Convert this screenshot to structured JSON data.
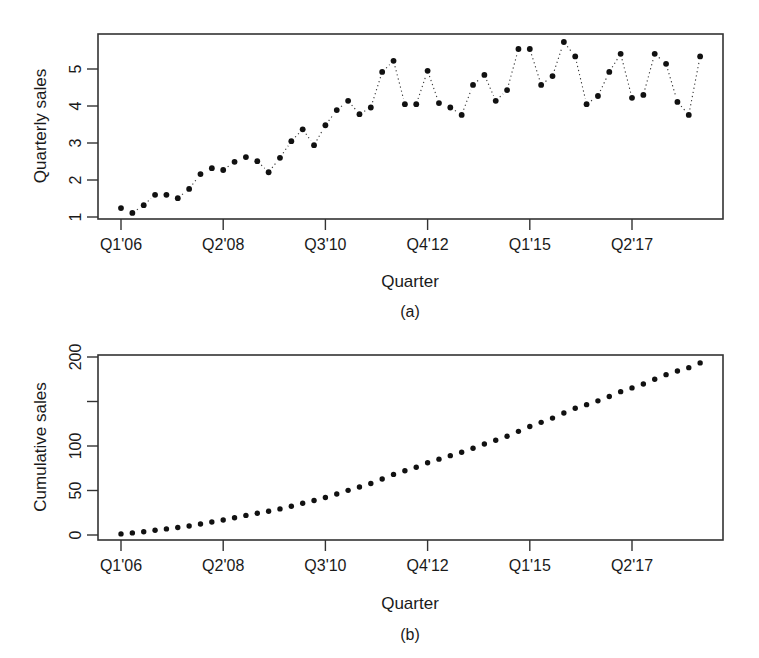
{
  "chart_data": [
    {
      "type": "scatter",
      "panel": "(a)",
      "title": "",
      "xlabel": "Quarter",
      "ylabel": "Quarterly sales",
      "caption": "(a)",
      "ylim": [
        1,
        5.8
      ],
      "yticks": [
        1,
        2,
        3,
        4,
        5
      ],
      "xtick_labels": [
        "Q1'06",
        "Q2'08",
        "Q3'10",
        "Q4'12",
        "Q1'15",
        "Q2'17"
      ],
      "xtick_indices": [
        0,
        9,
        18,
        27,
        36,
        45
      ],
      "grid": false,
      "legend": null,
      "style": "points connected by dotted line (type b)",
      "x": [
        "Q1'06",
        "Q2'06",
        "Q3'06",
        "Q4'06",
        "Q1'07",
        "Q2'07",
        "Q3'07",
        "Q4'07",
        "Q1'08",
        "Q2'08",
        "Q3'08",
        "Q4'08",
        "Q1'09",
        "Q2'09",
        "Q3'09",
        "Q4'09",
        "Q1'10",
        "Q2'10",
        "Q3'10",
        "Q4'10",
        "Q1'11",
        "Q2'11",
        "Q3'11",
        "Q4'11",
        "Q1'12",
        "Q2'12",
        "Q3'12",
        "Q4'12",
        "Q1'13",
        "Q2'13",
        "Q3'13",
        "Q4'13",
        "Q1'14",
        "Q2'14",
        "Q3'14",
        "Q4'14",
        "Q1'15",
        "Q2'15",
        "Q3'15",
        "Q4'15",
        "Q1'16",
        "Q2'16",
        "Q3'16",
        "Q4'16",
        "Q1'17",
        "Q2'17",
        "Q3'17",
        "Q4'17",
        "Q1'18",
        "Q2'18",
        "Q3'18",
        "Q4'18"
      ],
      "values": [
        1.24,
        1.11,
        1.32,
        1.6,
        1.6,
        1.51,
        1.76,
        2.16,
        2.32,
        2.27,
        2.49,
        2.62,
        2.51,
        2.21,
        2.6,
        3.05,
        3.37,
        2.94,
        3.48,
        3.89,
        4.14,
        3.78,
        3.96,
        4.92,
        5.22,
        4.05,
        4.05,
        4.95,
        4.08,
        3.96,
        3.76,
        4.57,
        4.84,
        4.14,
        4.43,
        5.54,
        5.54,
        4.57,
        4.81,
        5.73,
        5.34,
        4.05,
        4.27,
        4.92,
        5.41,
        4.22,
        4.3,
        5.41,
        5.14,
        4.11,
        3.76,
        5.34
      ]
    },
    {
      "type": "scatter",
      "panel": "(b)",
      "title": "",
      "xlabel": "Quarter",
      "ylabel": "Cumulative sales",
      "caption": "(b)",
      "ylim": [
        0,
        200
      ],
      "yticks": [
        0,
        50,
        100,
        150,
        200
      ],
      "ytick_labels": [
        "0",
        "50",
        "100",
        "",
        "200"
      ],
      "xtick_labels": [
        "Q1'06",
        "Q2'08",
        "Q3'10",
        "Q4'12",
        "Q1'15",
        "Q2'17"
      ],
      "xtick_indices": [
        0,
        9,
        18,
        27,
        36,
        45
      ],
      "grid": false,
      "legend": null,
      "style": "points",
      "derived_from": "cumulative sum of panel (a)",
      "values": [
        1.24,
        2.35,
        3.67,
        5.27,
        6.87,
        8.38,
        10.14,
        12.3,
        14.62,
        16.89,
        19.38,
        22.0,
        24.51,
        26.72,
        29.32,
        32.37,
        35.74,
        38.68,
        42.16,
        46.05,
        50.19,
        53.97,
        57.93,
        62.85,
        68.07,
        72.12,
        76.17,
        81.12,
        85.2,
        89.16,
        92.92,
        97.49,
        102.33,
        106.47,
        110.9,
        116.44,
        121.98,
        126.55,
        131.36,
        137.09,
        142.43,
        146.48,
        150.75,
        155.67,
        161.08,
        165.3,
        169.6,
        175.01,
        180.15,
        184.26,
        188.02,
        193.36
      ]
    }
  ]
}
